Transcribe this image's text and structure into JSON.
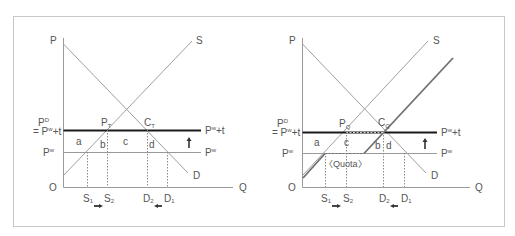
{
  "colors": {
    "frame": "#c8c8c8",
    "axis": "#9a9a9a",
    "curve": "#a0a0a0",
    "shifted_supply": "#707070",
    "tariff_line": "#1a1a1a",
    "world_price_line": "#9a9a9a",
    "dotted": "#8a8a8a",
    "arrow": "#333333",
    "text": "#555555"
  },
  "left_panel": {
    "title": "Tariff",
    "axis_y": "P",
    "axis_x": "Q",
    "origin": "O",
    "supply_label": "S",
    "demand_label": "D",
    "pd_label_top": "P",
    "pd_label_sup": "D",
    "pd_label_eq": "= P",
    "pd_label_eq_sup": "w",
    "pd_label_eq_tail": "+t",
    "pw_label": "P",
    "pw_label_sup": "w",
    "tariff_right_label": "P",
    "tariff_right_sup": "w",
    "tariff_right_tail": "+t",
    "pw_right_label": "P",
    "pw_right_sup": "w",
    "point_p": "P",
    "point_p_sub": "T",
    "point_c": "C",
    "point_c_sub": "T",
    "area_a": "a",
    "area_b": "b",
    "area_c": "c",
    "area_d": "d",
    "s1": "S",
    "s1_sub": "1",
    "s2": "S",
    "s2_sub": "2",
    "d2": "D",
    "d2_sub": "2",
    "d1": "D",
    "d1_sub": "1"
  },
  "right_panel": {
    "title": "Quota",
    "axis_y": "P",
    "axis_x": "Q",
    "origin": "O",
    "supply_label": "S",
    "demand_label": "D",
    "pd_label_top": "P",
    "pd_label_sup": "D",
    "pd_label_eq": "= P",
    "pd_label_eq_sup": "w",
    "pd_label_eq_tail": "+t",
    "pw_label": "P",
    "pw_label_sup": "w",
    "tariff_right_label": "P",
    "tariff_right_sup": "w",
    "tariff_right_tail": "+t",
    "pw_right_label": "P",
    "pw_right_sup": "w",
    "point_p": "P",
    "point_p_sub": "Q",
    "point_c": "C",
    "point_c_sub": "Q",
    "area_a": "a",
    "area_b": "b",
    "area_c": "c",
    "area_d": "d",
    "quota_label": "〈Quota〉",
    "s1": "S",
    "s1_sub": "1",
    "s2": "S",
    "s2_sub": "2",
    "d2": "D",
    "d2_sub": "2",
    "d1": "D",
    "d1_sub": "1"
  },
  "icons": {
    "price_up_arrow": "up-arrow",
    "supply_shift_arrow": "right-arrow",
    "demand_shift_arrow": "left-arrow"
  }
}
